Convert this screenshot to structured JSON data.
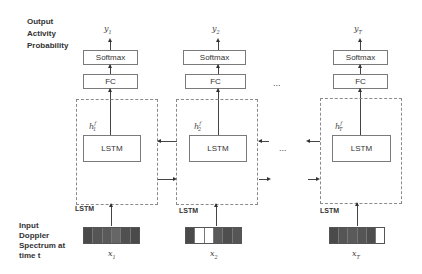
{
  "labels": {
    "output": [
      "Output",
      "Activity",
      "Probability"
    ],
    "input": [
      "Input",
      "Doppler",
      "Spectrum at",
      "time t"
    ]
  },
  "columns": [
    {
      "output_label": "y",
      "output_sub": "1",
      "softmax": "Softmax",
      "fc": "FC",
      "hidden_base": "h",
      "hidden_sup": "f",
      "hidden_sub": "1",
      "cell": "LSTM",
      "layer_tag": "LSTM",
      "input_label": "x",
      "input_sub": "1",
      "input_cells": [
        "#4a4a4a",
        "#555555",
        "#5a5a5a",
        "#666666",
        "#505050",
        "#4a4a4a"
      ]
    },
    {
      "output_label": "y",
      "output_sub": "2",
      "softmax": "Softmax",
      "fc": "FC",
      "hidden_base": "h",
      "hidden_sup": "f",
      "hidden_sub": "2",
      "cell": "LSTM",
      "layer_tag": "LSTM",
      "input_label": "x",
      "input_sub": "2",
      "input_cells": [
        "#4a4a4a",
        "#ffffff",
        "#ffffff",
        "#5a5a5a",
        "#4e4e4e",
        "#555555"
      ]
    },
    {
      "output_label": "y",
      "output_sub": "T",
      "softmax": "Softmax",
      "fc": "FC",
      "hidden_base": "h",
      "hidden_sup": "f",
      "hidden_sub": "T",
      "cell": "LSTM",
      "layer_tag": "LSTM",
      "input_label": "x",
      "input_sub": "T",
      "input_cells": [
        "#4a4a4a",
        "#555555",
        "#5a5a5a",
        "#555555",
        "#4e4e4e",
        "#ffffff"
      ]
    }
  ],
  "ellipsis": "..."
}
